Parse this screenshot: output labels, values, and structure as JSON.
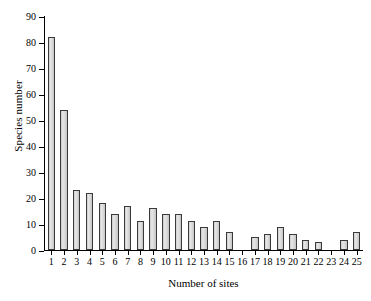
{
  "chart_data": {
    "type": "bar",
    "title": "",
    "xlabel": "Number of sites",
    "ylabel": "Species number",
    "categories": [
      "1",
      "2",
      "3",
      "4",
      "5",
      "6",
      "7",
      "8",
      "9",
      "10",
      "11",
      "12",
      "13",
      "14",
      "15",
      "16",
      "17",
      "18",
      "19",
      "20",
      "21",
      "22",
      "23",
      "24",
      "25"
    ],
    "values": [
      82,
      54,
      23,
      22,
      18,
      14,
      17,
      11,
      16,
      14,
      14,
      11,
      9,
      11,
      7,
      0,
      5,
      6,
      9,
      6,
      4,
      3,
      0,
      4,
      7
    ],
    "ylim": [
      0,
      90
    ],
    "yticks": [
      0,
      10,
      20,
      30,
      40,
      50,
      60,
      70,
      80,
      90
    ],
    "ytick_labels": [
      "0",
      "10",
      "20",
      "30",
      "40",
      "50",
      "60",
      "70",
      "80",
      "90"
    ],
    "xlim": [
      0.4,
      25.6
    ],
    "grid": false,
    "legend": null,
    "bar_fill": "#dcdcdc",
    "bar_edge": "#3a3a3a",
    "axis_color": "#000000"
  }
}
